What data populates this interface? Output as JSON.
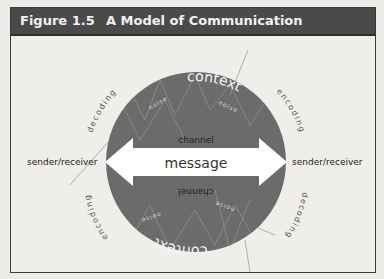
{
  "figure": {
    "number": "Figure 1.5",
    "title": "A Model of Communication"
  },
  "diagram": {
    "top_context": "context",
    "bottom_context": "context",
    "noise_labels": [
      "noise",
      "noise",
      "noise",
      "noise"
    ],
    "channel_top": "channel",
    "channel_bottom": "channel",
    "message": "message",
    "left_node": "sender/receiver",
    "right_node": "sender/receiver",
    "left_upper_arc": "decoding",
    "left_lower_arc": "encoding",
    "right_upper_arc": "encoding",
    "right_lower_arc": "decoding"
  },
  "colors": {
    "header_bg": "#4a4a4a",
    "circle_fill": "#6b6b6b",
    "arrow_fill": "#ffffff",
    "page_bg": "#efeeeb"
  }
}
